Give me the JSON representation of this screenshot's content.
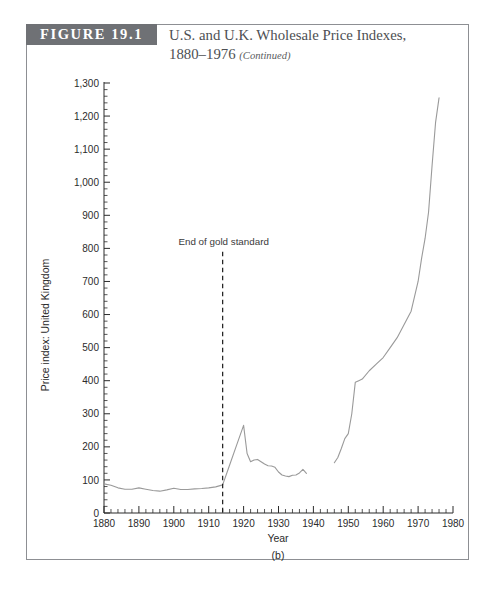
{
  "figure": {
    "tag": "FIGURE 19.1",
    "title_line1": "U.S. and U.K. Wholesale Price Indexes,",
    "title_line2": "1880–1976",
    "title_continued": "(Continued)",
    "panel_label": "(b)"
  },
  "colors": {
    "tag_background": "#6f7175",
    "tag_text": "#ffffff",
    "title_text": "#4d4f53",
    "frame_border": "#8d8f93",
    "axis": "#2b2b2b",
    "series_line": "#9a9a9a",
    "annotation_line": "#1a1a1a"
  },
  "chart_data": {
    "type": "line",
    "title": "U.S. and U.K. Wholesale Price Indexes, 1880–1976 (Continued)",
    "xlabel": "Year",
    "ylabel": "Price index: United Kingdom",
    "xlim": [
      1880,
      1980
    ],
    "ylim": [
      0,
      1300
    ],
    "xticks": [
      1880,
      1890,
      1900,
      1910,
      1920,
      1930,
      1940,
      1950,
      1960,
      1970,
      1980
    ],
    "xtick_labels": [
      "1880",
      "1890",
      "1900",
      "1910",
      "1920",
      "1930",
      "1940",
      "1950",
      "1960",
      "1970",
      "1980"
    ],
    "yticks": [
      0,
      100,
      200,
      300,
      400,
      500,
      600,
      700,
      800,
      900,
      1000,
      1100,
      1200,
      1300
    ],
    "ytick_labels": [
      "0",
      "100",
      "200",
      "300",
      "400",
      "500",
      "600",
      "700",
      "800",
      "900",
      "1,000",
      "1,100",
      "1,200",
      "1,300"
    ],
    "minor_tick_interval_x": 2,
    "minor_tick_interval_y": 20,
    "grid": false,
    "legend": false,
    "annotations": [
      {
        "text": "End of gold standard",
        "x": 1914,
        "type": "vertical-dashed-line",
        "line_top_value": 790,
        "line_bottom_value": 0
      }
    ],
    "series": [
      {
        "name": "Price index: United Kingdom",
        "segments": [
          {
            "name": "1880-1938",
            "x": [
              1880,
              1882,
              1884,
              1886,
              1888,
              1890,
              1892,
              1894,
              1896,
              1898,
              1900,
              1902,
              1904,
              1906,
              1908,
              1910,
              1912,
              1914,
              1916,
              1918,
              1920,
              1921,
              1922,
              1923,
              1924,
              1925,
              1926,
              1927,
              1928,
              1929,
              1930,
              1931,
              1932,
              1933,
              1934,
              1935,
              1936,
              1937,
              1938
            ],
            "y": [
              88,
              84,
              76,
              72,
              72,
              76,
              72,
              68,
              66,
              70,
              75,
              71,
              71,
              73,
              74,
              76,
              79,
              85,
              145,
              205,
              265,
              180,
              155,
              160,
              162,
              155,
              148,
              143,
              142,
              138,
              124,
              115,
              112,
              110,
              114,
              115,
              121,
              132,
              120
            ]
          },
          {
            "name": "1946-1976",
            "x": [
              1946,
              1947,
              1948,
              1949,
              1950,
              1951,
              1952,
              1953,
              1954,
              1956,
              1958,
              1960,
              1962,
              1964,
              1966,
              1968,
              1970,
              1971,
              1972,
              1973,
              1974,
              1975,
              1976
            ],
            "y": [
              152,
              168,
              195,
              225,
              240,
              300,
              395,
              400,
              405,
              430,
              450,
              470,
              500,
              530,
              570,
              610,
              700,
              770,
              830,
              910,
              1050,
              1180,
              1255
            ]
          }
        ]
      }
    ]
  }
}
